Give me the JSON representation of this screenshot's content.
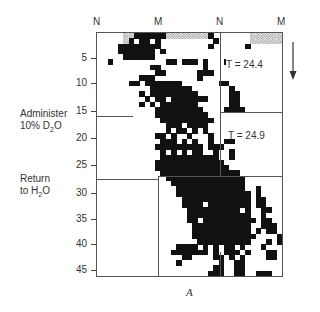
{
  "figure": {
    "column_headers": [
      "N",
      "M",
      "N",
      "M"
    ],
    "y_axis": {
      "ticks": [
        "5",
        "10",
        "15",
        "20",
        "25",
        "30",
        "35",
        "40",
        "45"
      ]
    },
    "annotations": {
      "administer_line1": "Administer",
      "administer_line2_pre": "10% D",
      "administer_sub": "2",
      "administer_line2_post": "O",
      "return_line1": "Return",
      "return_line2_pre": "to H",
      "return_sub": "2",
      "return_line2_post": "O",
      "t1": "T = 24.4",
      "t2": "T = 24.9"
    },
    "panel_label": "A",
    "arrow": "down-arrow",
    "grid": {
      "columns": 35,
      "rows": 46,
      "legend": "# = filled, h = hatched, . = empty",
      "cells": [
        ".....hh######hhhhhhhh#.......hhhhhh",
        ".....h#.##.#..........#......hhhhhh",
        "....########.........#......#......",
        "....#######.#.....................",
        ".....######.......................",
        "..#..........##.###.#...#.........",
        "..........##........#..............",
        "...........##......###.............",
        "........###........#..............",
        "......##.#######.......##..........",
        "..........########.......#.........",
        "........#.#########......##........",
        ".........#.##.#######....##........",
        "........#.#.#######......##........",
        "...........#########....####.......",
        "...........##########.............",
        "............##########............",
        ".............###.####.............",
        ".............#.##.#.#.............",
        "...........##.#..#...#............",
        "............###.#.#..#..##........",
        "...........#########.###..........",
        "............#.#.#.##..#..#........",
        "............###########..#........",
        "...........#############..........",
        "...........##############.........",
        "............###############.......",
        ".............###############.......",
        "..............##############.......",
        "...............#############..#....",
        "...............##############.#....",
        "................#############.##...",
        "................####.########.##...",
        ".................##########.#..##..",
        ".................############..#...",
        ".................##.##########.##..",
        "..................###########..###.",
        "..................###########.#.##.",
        "..................############....#",
        "...................##########...#.#",
        "...............####.#.#.##.#...#...",
        "..............#######.#.###.#...##.",
        "................##....##.#.#....##.",
        "...............#.......#..##.......",
        "......................##..##.......",
        ".....................###..##..###.."
      ]
    }
  }
}
